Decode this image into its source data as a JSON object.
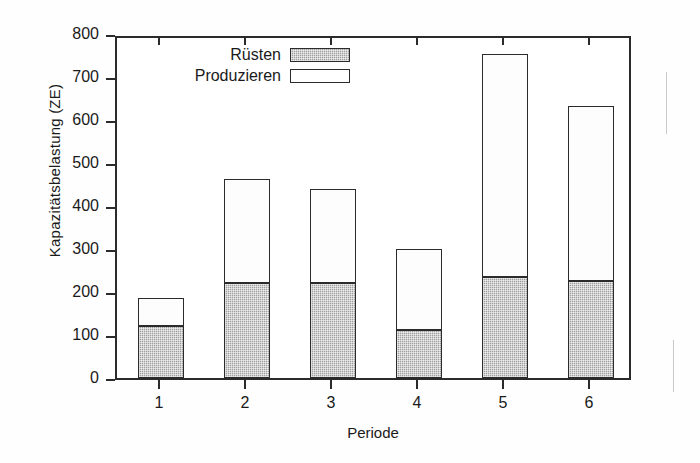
{
  "chart_data": {
    "type": "bar",
    "subtype": "stacked-vertical",
    "title": "",
    "xlabel": "Periode",
    "ylabel": "Kapazitätsbelastung (ZE)",
    "categories": [
      "1",
      "2",
      "3",
      "4",
      "5",
      "6"
    ],
    "series": [
      {
        "name": "Rüsten",
        "values": [
          121,
          221,
          221,
          112,
          234,
          226
        ]
      },
      {
        "name": "Produzieren",
        "values": [
          65,
          241,
          218,
          188,
          519,
          407
        ]
      }
    ],
    "totals": [
      186,
      462,
      439,
      300,
      753,
      633
    ],
    "ylim": [
      0,
      800
    ],
    "yticks": [
      0,
      100,
      200,
      300,
      400,
      500,
      600,
      700,
      800
    ],
    "ytick_labels": [
      "0",
      "100",
      "200",
      "300",
      "400",
      "500",
      "600",
      "700",
      "800"
    ],
    "xtick_labels": [
      "1",
      "2",
      "3",
      "4",
      "5",
      "6"
    ],
    "grid": false,
    "legend_position": "top-center",
    "colors": {
      "setup": "#9e9e9e",
      "produce": "#fdfdfd",
      "axis": "#2b2b2b",
      "text": "#1a1a1a",
      "background": "#ffffff"
    }
  },
  "legend": {
    "entries": [
      {
        "label": "Rüsten",
        "swatch": "hatched-gray"
      },
      {
        "label": "Produzieren",
        "swatch": "white-outline"
      }
    ]
  },
  "axes": {
    "y_title": "Kapazitätsbelastung (ZE)",
    "x_title": "Periode"
  }
}
